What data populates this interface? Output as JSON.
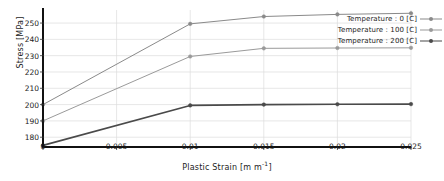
{
  "chart_data": {
    "type": "line",
    "title": "",
    "xlabel": "Plastic Strain  [m m^-1]",
    "xlabel_base": "Plastic Strain  [m m",
    "xlabel_sup": "-1",
    "xlabel_tail": "]",
    "ylabel": "Stress  [MPa]",
    "x": [
      0,
      0.005,
      0.01,
      0.015,
      0.02,
      0.025
    ],
    "xlim": [
      0,
      0.025
    ],
    "ylim": [
      174,
      258
    ],
    "xticks": [
      "0",
      "0.005",
      "0.01",
      "0.015",
      "0.02",
      "0.025"
    ],
    "xtick_values": [
      0,
      0.005,
      0.01,
      0.015,
      0.02,
      0.025
    ],
    "yticks": [
      "180",
      "190",
      "200",
      "210",
      "220",
      "230",
      "240",
      "250"
    ],
    "ytick_values": [
      180,
      190,
      200,
      210,
      220,
      230,
      240,
      250
    ],
    "grid": true,
    "legend_position": "top-right",
    "series": [
      {
        "name": "Temperature : 0 [C]",
        "color": "#8a8a8a",
        "width": 1.0,
        "marker": "circle",
        "x": [
          0,
          0.01,
          0.015,
          0.02,
          0.025
        ],
        "values": [
          200,
          249.5,
          254,
          255.3,
          256
        ]
      },
      {
        "name": "Temperature : 100 [C]",
        "color": "#9a9a9a",
        "width": 1.0,
        "marker": "circle",
        "x": [
          0,
          0.01,
          0.015,
          0.02,
          0.025
        ],
        "values": [
          190,
          229.5,
          234.5,
          234.7,
          234.8
        ]
      },
      {
        "name": "Temperature : 200 [C]",
        "color": "#4a4a4a",
        "width": 1.6,
        "marker": "circle",
        "x": [
          0,
          0.01,
          0.015,
          0.02,
          0.025
        ],
        "values": [
          175,
          199.5,
          200,
          200.2,
          200.3
        ]
      }
    ]
  },
  "legend": {
    "items": [
      {
        "label": "Temperature : 0 [C]"
      },
      {
        "label": "Temperature : 100 [C]"
      },
      {
        "label": "Temperature : 200 [C]"
      }
    ]
  }
}
